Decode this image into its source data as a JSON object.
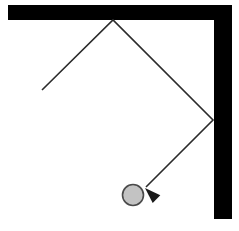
{
  "canvas": {
    "width": 239,
    "height": 231,
    "background_color": "#ffffff"
  },
  "colors": {
    "wall": "#000000",
    "trajectory": "#2b2b2b",
    "ball_fill": "#c3c3c3",
    "ball_stroke": "#4a4a4a",
    "arrow": "#1a1a1a"
  },
  "walls": [
    {
      "name": "top-wall",
      "orientation": "horizontal",
      "x": 8,
      "y": 5,
      "width": 224,
      "height": 15,
      "color": "#000000"
    },
    {
      "name": "right-wall",
      "orientation": "vertical",
      "x": 214,
      "y": 5,
      "width": 18,
      "height": 214,
      "color": "#000000"
    }
  ],
  "trajectory": {
    "name": "ball-path",
    "stroke_color": "#2b2b2b",
    "stroke_width": 1.6,
    "points": [
      {
        "label": "start",
        "x": 42,
        "y": 90
      },
      {
        "label": "bounce-top-wall",
        "x": 113,
        "y": 20
      },
      {
        "label": "bounce-right-wall",
        "x": 213,
        "y": 120
      },
      {
        "label": "end-at-ball",
        "x": 146,
        "y": 187
      }
    ],
    "segments": [
      {
        "name": "incoming-segment",
        "from": "start",
        "to": "bounce-top-wall"
      },
      {
        "name": "middle-segment",
        "from": "bounce-top-wall",
        "to": "bounce-right-wall"
      },
      {
        "name": "outgoing-segment",
        "from": "bounce-right-wall",
        "to": "end-at-ball"
      }
    ]
  },
  "arrowhead": {
    "name": "direction-arrowhead",
    "tip_x": 145,
    "tip_y": 188,
    "angle_deg": 224,
    "length": 16,
    "half_width": 5.5,
    "color": "#1a1a1a"
  },
  "ball": {
    "name": "ball",
    "center_x": 133,
    "center_y": 195,
    "radius": 10.5,
    "fill_color": "#c3c3c3",
    "stroke_color": "#4a4a4a",
    "stroke_width": 1.6
  }
}
